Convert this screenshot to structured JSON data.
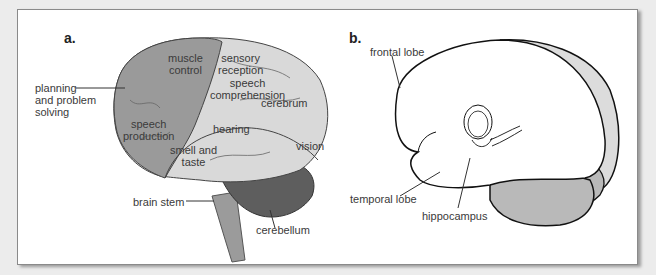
{
  "figure": {
    "panel_a": {
      "letter": "a.",
      "labels": {
        "muscle_control": [
          "muscle",
          "control"
        ],
        "sensory_reception": [
          "sensory",
          "reception"
        ],
        "speech_comprehension": [
          "speech",
          "comprehension"
        ],
        "cerebrum": "cerebrum",
        "planning": [
          "planning",
          "and problem",
          "solving"
        ],
        "speech_production": [
          "speech",
          "production"
        ],
        "hearing": "hearing",
        "smell_taste": [
          "smell and",
          "taste"
        ],
        "vision": "vision",
        "brain_stem": "brain stem",
        "cerebellum": "cerebellum"
      }
    },
    "panel_b": {
      "letter": "b.",
      "labels": {
        "frontal_lobe": "frontal lobe",
        "temporal_lobe": "temporal lobe",
        "hippocampus": "hippocampus"
      }
    },
    "colors": {
      "background": "#ececec",
      "panel": "#ffffff",
      "frontal_region": "#9a9a9a",
      "cerebrum_light": "#d9d9d9",
      "cerebellum": "#5e5e5e",
      "brain_stem": "#9b9b9b",
      "shade_light": "#dcdcdc",
      "shade_mid": "#b9b9b9"
    }
  }
}
